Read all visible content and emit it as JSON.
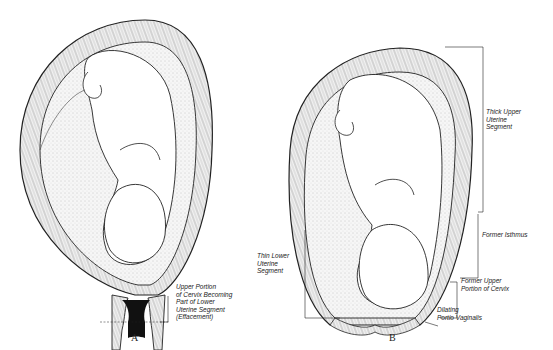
{
  "figure": {
    "panels": [
      {
        "id": "A",
        "caption": "A",
        "labels": [
          {
            "key": "effacement",
            "text": "Upper Portion\nof Cervix Becoming\nPart of Lower\nUterine Segment\n(Effacement)"
          }
        ]
      },
      {
        "id": "B",
        "caption": "B",
        "labels": [
          {
            "key": "thick_upper",
            "text": "Thick Upper\nUterine\nSegment"
          },
          {
            "key": "former_isthmus",
            "text": "Former Isthmus"
          },
          {
            "key": "thin_lower",
            "text": "Thin Lower\nUterine\nSegment"
          },
          {
            "key": "former_upper_cervix",
            "text": "Former Upper\nPortion of Cervix"
          },
          {
            "key": "dilating_portio",
            "text": "Dilating\nPortio Vaginalis"
          }
        ]
      }
    ]
  },
  "colors": {
    "ink": "#222222",
    "background": "#ffffff",
    "stipple": "#d8d8d8"
  }
}
